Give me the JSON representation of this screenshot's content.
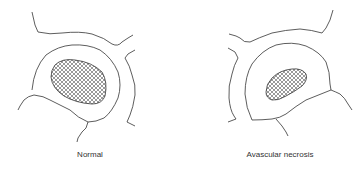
{
  "figure": {
    "panels": [
      {
        "id": "normal",
        "label": "Normal",
        "lesion": "large hatched oval in center of bone section"
      },
      {
        "id": "avn",
        "label": "Avascular necrosis",
        "lesion": "smaller, flattened hatched region"
      }
    ],
    "colors": {
      "line": "#333333",
      "hatch": "#555555",
      "background": "#ffffff"
    }
  }
}
